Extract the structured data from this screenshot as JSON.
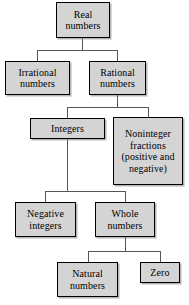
{
  "diagram": {
    "type": "hierarchy-tree",
    "palette": {
      "node_fill": "#d4d4d4",
      "node_border": "#000000",
      "connector": "#555555",
      "background": "#ffffff",
      "text": "#000000"
    },
    "nodes": [
      {
        "id": "real-numbers",
        "label": "Real\nnumbers",
        "level": 0,
        "x": 56,
        "y": 2,
        "w": 54,
        "h": 36
      },
      {
        "id": "irrational-numbers",
        "label": "Irrational\nnumbers",
        "level": 1,
        "x": 5,
        "y": 61,
        "w": 65,
        "h": 34
      },
      {
        "id": "rational-numbers",
        "label": "Rational\nnumbers",
        "level": 1,
        "x": 89,
        "y": 61,
        "w": 57,
        "h": 34
      },
      {
        "id": "integers",
        "label": "Integers",
        "level": 2,
        "x": 30,
        "y": 118,
        "w": 75,
        "h": 21
      },
      {
        "id": "noninteger-fractions",
        "label": "Noninteger\nfractions\n(positive and\nnegative)",
        "level": 2,
        "x": 113,
        "y": 117,
        "w": 70,
        "h": 68
      },
      {
        "id": "negative-integers",
        "label": "Negative\nintegers",
        "level": 3,
        "x": 15,
        "y": 202,
        "w": 61,
        "h": 35
      },
      {
        "id": "whole-numbers",
        "label": "Whole\nnumbers",
        "level": 3,
        "x": 95,
        "y": 202,
        "w": 60,
        "h": 35
      },
      {
        "id": "natural-numbers",
        "label": "Natural\nnumbers",
        "level": 4,
        "x": 57,
        "y": 262,
        "w": 61,
        "h": 35
      },
      {
        "id": "zero",
        "label": "Zero",
        "level": 4,
        "x": 140,
        "y": 262,
        "w": 40,
        "h": 21
      }
    ],
    "edges": [
      {
        "id": "real-to-children",
        "from": "real-numbers",
        "to": [
          "irrational-numbers",
          "rational-numbers"
        ]
      },
      {
        "id": "rational-to-children",
        "from": "rational-numbers",
        "to": [
          "integers",
          "noninteger-fractions"
        ]
      },
      {
        "id": "integers-to-children",
        "from": "integers",
        "to": [
          "negative-integers",
          "whole-numbers"
        ]
      },
      {
        "id": "whole-to-children",
        "from": "whole-numbers",
        "to": [
          "natural-numbers",
          "zero"
        ]
      }
    ]
  }
}
